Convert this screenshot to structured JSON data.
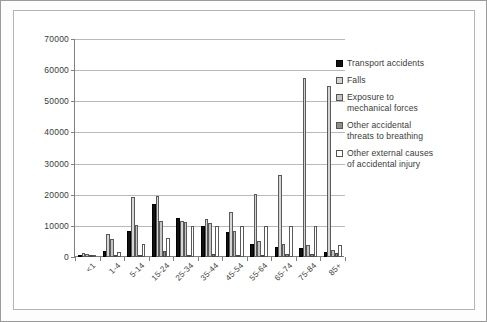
{
  "chart_data": {
    "type": "bar",
    "title": "",
    "subtitle": "",
    "xlabel": "",
    "ylabel": "",
    "ylim": [
      0,
      70000
    ],
    "ytick_values": [
      0,
      10000,
      20000,
      30000,
      40000,
      50000,
      60000,
      70000
    ],
    "ytick_labels": [
      "0",
      "10000",
      "20000",
      "30000",
      "40000",
      "50000",
      "60000",
      "70000"
    ],
    "grid": true,
    "legend_position": "right",
    "categories": [
      "<1",
      "1-4",
      "5-14",
      "15-24",
      "25-34",
      "35-44",
      "45-54",
      "55-64",
      "65-74",
      "75-84",
      "85+"
    ],
    "series": [
      {
        "name": "Transport accidents",
        "color": "#111111",
        "values": [
          600,
          1900,
          8400,
          17000,
          12500,
          9800,
          8000,
          4200,
          3300,
          3000,
          1600
        ]
      },
      {
        "name": "Falls",
        "color": "#d5d5d5",
        "values": [
          1200,
          7400,
          19200,
          19700,
          11500,
          12100,
          14300,
          20200,
          26400,
          57500,
          55000
        ]
      },
      {
        "name": "Exposure to mechanical forces",
        "color": "#c4c4c4",
        "values": [
          900,
          5800,
          10400,
          11700,
          11400,
          11000,
          8200,
          5100,
          4100,
          3700,
          2400
        ]
      },
      {
        "name": "Other accidental threats to breathing",
        "color": "#8e8e8e",
        "values": [
          700,
          400,
          600,
          1800,
          500,
          1000,
          800,
          700,
          900,
          1100,
          1400
        ]
      },
      {
        "name": "Other external causes of accidental injury",
        "color": "#ffffff",
        "values": [
          600,
          1500,
          4100,
          6100,
          9900,
          9800,
          9900,
          9800,
          9800,
          9900,
          3800
        ]
      }
    ]
  },
  "legend": {
    "items": [
      {
        "label": "Transport accidents"
      },
      {
        "label": "Falls"
      },
      {
        "label": "Exposure to\nmechanical forces"
      },
      {
        "label": "Other accidental\nthreats to breathing"
      },
      {
        "label": "Other external causes\nof accidental injury"
      }
    ]
  }
}
